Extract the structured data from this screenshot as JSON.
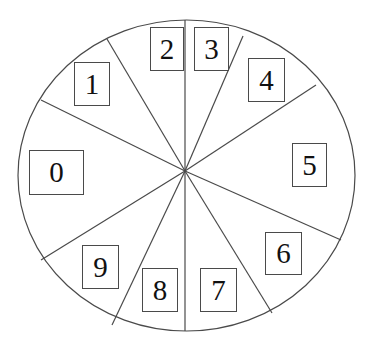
{
  "figure": {
    "type": "sector-wheel-diagram",
    "title": "",
    "background_color": "#ffffff",
    "outline_color": "#4a4a4a",
    "label_text_color": "#111111",
    "sector_count": 10
  },
  "wheel": {
    "center": {
      "x": 185,
      "y": 171
    },
    "ellipse": {
      "cx": 186.5,
      "cy": 175.5,
      "rx": 168.5,
      "ry": 155.5
    },
    "stroke_width": 1.2
  },
  "sectors": [
    {
      "label": "0",
      "box": {
        "x": 29,
        "y": 150,
        "w": 55,
        "h": 45
      },
      "spoke_end": {
        "x": 41,
        "y": 100
      }
    },
    {
      "label": "1",
      "box": {
        "x": 74,
        "y": 62,
        "w": 36,
        "h": 44
      },
      "spoke_end": {
        "x": 107,
        "y": 39
      }
    },
    {
      "label": "2",
      "box": {
        "x": 150,
        "y": 27,
        "w": 34,
        "h": 44
      },
      "spoke_end": {
        "x": 185,
        "y": 20
      }
    },
    {
      "label": "3",
      "box": {
        "x": 194,
        "y": 27,
        "w": 35,
        "h": 44
      },
      "spoke_end": {
        "x": 243,
        "y": 36
      }
    },
    {
      "label": "4",
      "box": {
        "x": 248,
        "y": 58,
        "w": 37,
        "h": 44
      },
      "spoke_end": {
        "x": 316,
        "y": 85
      }
    },
    {
      "label": "5",
      "box": {
        "x": 292,
        "y": 143,
        "w": 35,
        "h": 44
      },
      "spoke_end": {
        "x": 341,
        "y": 240
      }
    },
    {
      "label": "6",
      "box": {
        "x": 265,
        "y": 232,
        "w": 37,
        "h": 43
      },
      "spoke_end": {
        "x": 272,
        "y": 313
      }
    },
    {
      "label": "7",
      "box": {
        "x": 200,
        "y": 268,
        "w": 37,
        "h": 44
      },
      "spoke_end": {
        "x": 185,
        "y": 331
      }
    },
    {
      "label": "8",
      "box": {
        "x": 142,
        "y": 268,
        "w": 36,
        "h": 44
      },
      "spoke_end": {
        "x": 112,
        "y": 325
      }
    },
    {
      "label": "9",
      "box": {
        "x": 82,
        "y": 245,
        "w": 37,
        "h": 44
      },
      "spoke_end": {
        "x": 41,
        "y": 260
      }
    }
  ]
}
